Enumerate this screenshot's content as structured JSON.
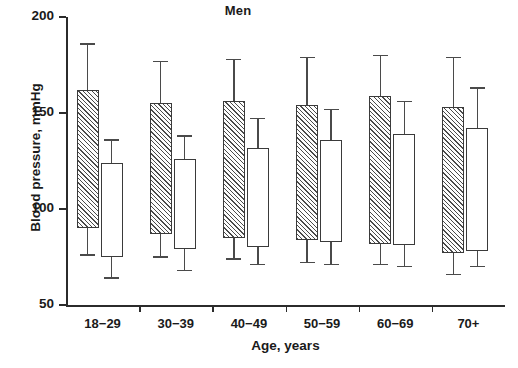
{
  "chart_data": {
    "type": "bar",
    "variant": "floating-range-bars-with-error-bars",
    "title": "Men",
    "xlabel": "Age, years",
    "ylabel": "Blood pressure, mmHg",
    "ylim": [
      50,
      200
    ],
    "yticks": [
      50,
      100,
      150,
      200
    ],
    "ytick_labels": [
      "50",
      "100",
      "150",
      "200"
    ],
    "grid": false,
    "legend": "none",
    "categories": [
      "18−29",
      "30−39",
      "40−49",
      "50−59",
      "60−69",
      "70+"
    ],
    "series": [
      {
        "name": "hatched-bar",
        "style": "diagonal-hatch",
        "description": "Blood pressure range, first bar of each age pair",
        "bar_top": [
          162,
          155,
          156,
          154,
          159,
          153
        ],
        "bar_bottom": [
          90,
          87,
          85,
          84,
          82,
          77
        ],
        "error_top": [
          186,
          177,
          178,
          179,
          180,
          179
        ],
        "error_bottom": [
          76,
          75,
          74,
          72,
          71,
          66
        ]
      },
      {
        "name": "open-bar",
        "style": "white-fill",
        "description": "Blood pressure range, second bar of each age pair",
        "bar_top": [
          124,
          126,
          132,
          136,
          139,
          142
        ],
        "bar_bottom": [
          75,
          79,
          80,
          83,
          81,
          78
        ],
        "error_top": [
          136,
          138,
          147,
          152,
          156,
          163
        ],
        "error_bottom": [
          64,
          68,
          71,
          71,
          70,
          70
        ]
      }
    ]
  },
  "axis": {
    "title": "Men",
    "x_title": "Age, years",
    "y_title": "Blood pressure, mmHg"
  }
}
